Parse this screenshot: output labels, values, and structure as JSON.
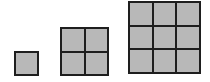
{
  "diagram": {
    "title": "",
    "colors": {
      "cell_fill": "#b8b8b8",
      "border": "#1e1e1e",
      "background": "#ffffff"
    },
    "figures": [
      {
        "label": "",
        "n": 1,
        "cells": 1,
        "x": 14,
        "y": 51,
        "size": 25
      },
      {
        "label": "",
        "n": 2,
        "cells": 4,
        "x": 60,
        "y": 27,
        "size": 49
      },
      {
        "label": "",
        "n": 3,
        "cells": 9,
        "x": 128,
        "y": 1,
        "size": 73
      }
    ]
  }
}
